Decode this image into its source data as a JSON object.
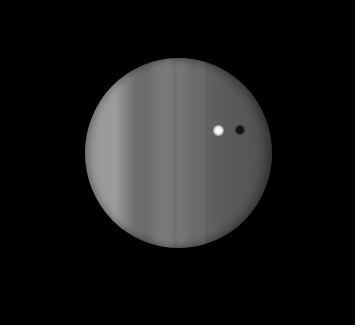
{
  "image": {
    "subject": "gas giant planet with vertical cloud bands, a bright moon and its shadow transiting the disk",
    "colors": {
      "background": "#000000",
      "border": "#ffffff",
      "planet_light_band": "#9a9a9a",
      "planet_dark_band": "#5a5a5a",
      "moon": "#ffffff",
      "moon_shadow": "#0a0a0a"
    }
  }
}
